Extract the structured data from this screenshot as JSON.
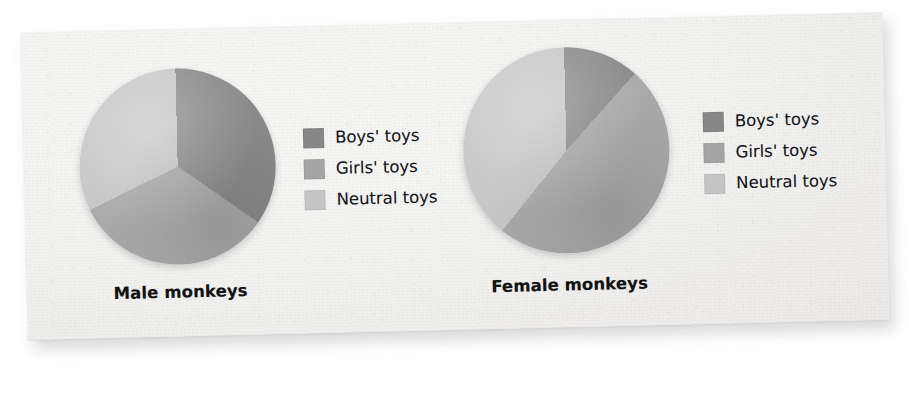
{
  "figure": {
    "background_color": "#f2f2f1",
    "page_color": "#ffffff"
  },
  "colors": {
    "boys": "#8a8a8a",
    "girls": "#a9a9a9",
    "neutral": "#c6c6c6",
    "boys_swatch": "#878787",
    "girls_swatch": "#a5a5a5",
    "neutral_swatch": "#c4c4c4",
    "caption_text": "#121212",
    "legend_text": "#16161a"
  },
  "legend": {
    "boys_label": "Boys' toys",
    "girls_label": "Girls' toys",
    "neutral_label": "Neutral toys",
    "swatch_boys": "boys-toys-swatch",
    "swatch_girls": "girls-toys-swatch",
    "swatch_neutral": "neutral-toys-swatch"
  },
  "charts": {
    "male": {
      "caption": "Male monkeys"
    },
    "female": {
      "caption": "Female monkeys"
    }
  },
  "chart_data": [
    {
      "type": "pie",
      "title": "Male monkeys",
      "categories": [
        "Boys' toys",
        "Girls' toys",
        "Neutral toys"
      ],
      "values": [
        35,
        33,
        32
      ],
      "unit": "percent",
      "start_angle_deg": 0,
      "direction": "clockwise",
      "slice_angles_deg": [
        126,
        119,
        115
      ],
      "colors": [
        "#8a8a8a",
        "#a9a9a9",
        "#c6c6c6"
      ],
      "legend_position": "right",
      "grid": false,
      "labels_shown": false
    },
    {
      "type": "pie",
      "title": "Female monkeys",
      "categories": [
        "Boys' toys",
        "Girls' toys",
        "Neutral toys"
      ],
      "values": [
        12,
        49,
        39
      ],
      "unit": "percent",
      "start_angle_deg": 0,
      "direction": "clockwise",
      "slice_angles_deg": [
        43,
        177,
        140
      ],
      "colors": [
        "#8a8a8a",
        "#a9a9a9",
        "#c6c6c6"
      ],
      "legend_position": "right",
      "grid": false,
      "labels_shown": false
    }
  ]
}
